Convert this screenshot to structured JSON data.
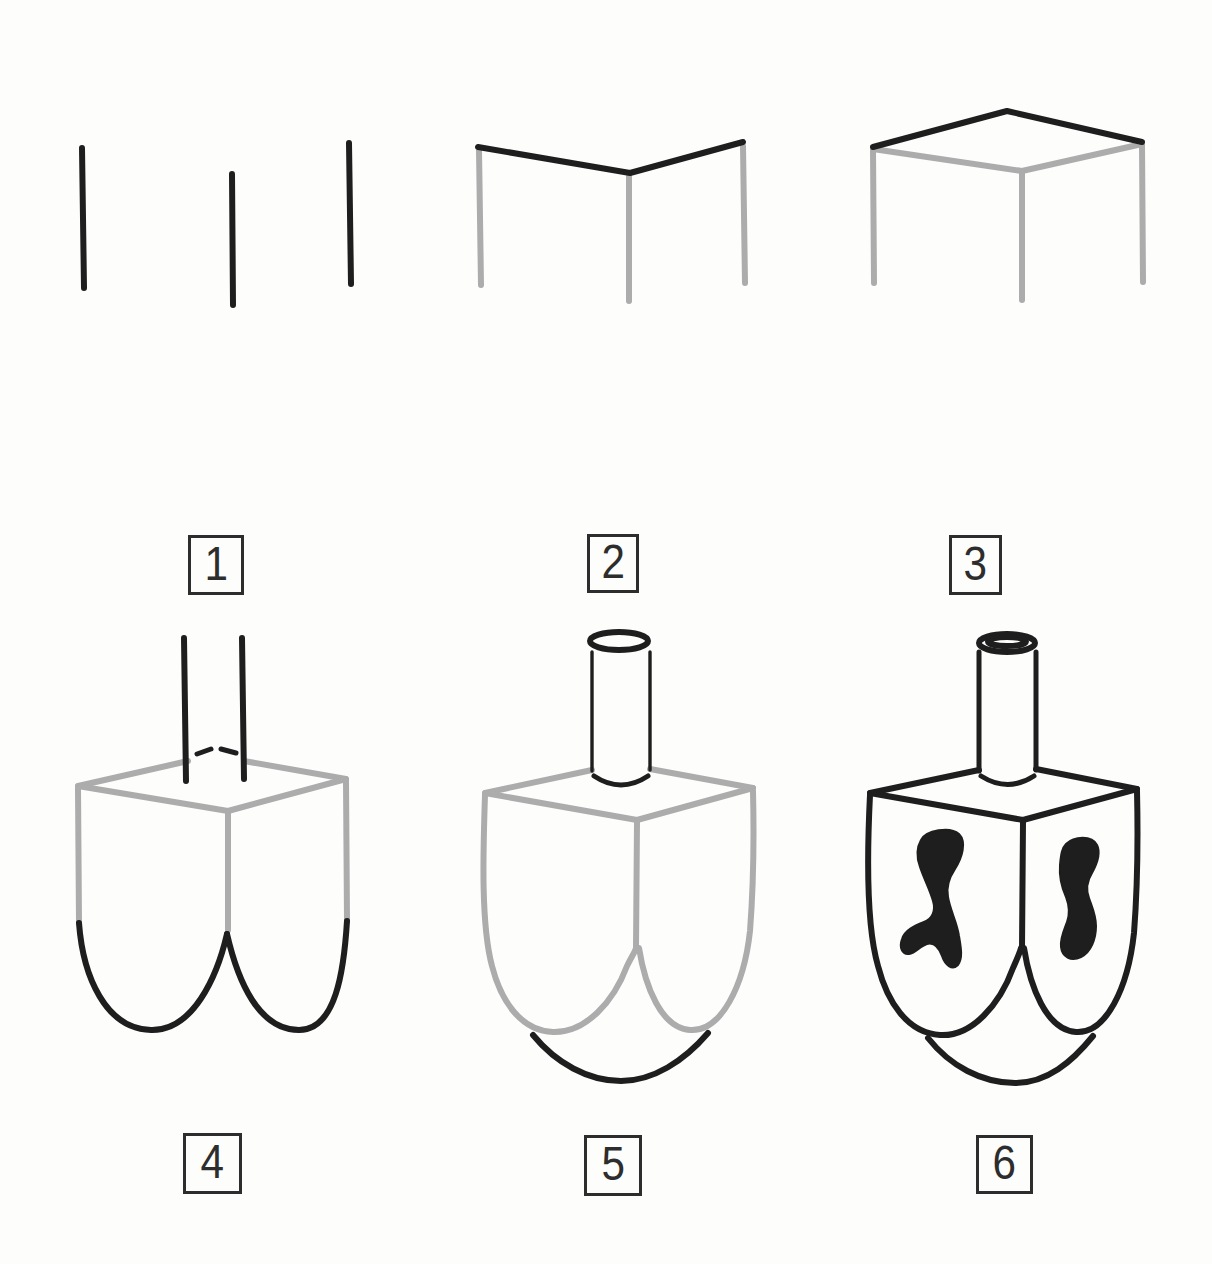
{
  "page": {
    "background": "#fdfdfb"
  },
  "colors": {
    "ink": "#1e1e1e",
    "guide": "#acacac",
    "box_border": "#2d2d2d",
    "number": "#2d2d2d"
  },
  "steps": [
    {
      "label": "1"
    },
    {
      "label": "2"
    },
    {
      "label": "3"
    },
    {
      "label": "4"
    },
    {
      "label": "5"
    },
    {
      "label": "6"
    }
  ]
}
